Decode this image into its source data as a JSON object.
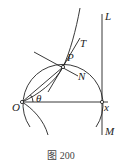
{
  "caption": "图 200",
  "labels": {
    "L": "L",
    "M": "M",
    "T": "T",
    "P": "P",
    "N": "N",
    "O": "O",
    "theta": "θ",
    "x": "x"
  },
  "geometry": {
    "origin": [
      22,
      102
    ],
    "point_P": [
      63,
      67
    ],
    "circle_center": [
      62,
      102
    ],
    "circle_radius": 40,
    "vertical_line_x": 102
  },
  "colors": {
    "stroke": "#222222",
    "background": "#ffffff"
  }
}
